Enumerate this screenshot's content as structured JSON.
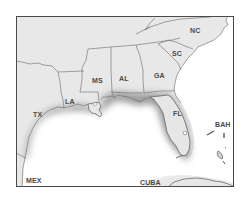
{
  "map": {
    "type": "regional-map",
    "region": "Southeastern United States and Gulf of Mexico",
    "colors": {
      "land": "#e6e6e6",
      "water": "#ffffff",
      "coastal_shading": "#8c8c8c",
      "border": "#5a5a5a",
      "label": "#4a4a4a"
    },
    "labels": [
      {
        "id": "nc",
        "text": "NC",
        "x": 190,
        "y": 33
      },
      {
        "id": "sc",
        "text": "SC",
        "x": 172,
        "y": 56
      },
      {
        "id": "ga",
        "text": "GA",
        "x": 154,
        "y": 78
      },
      {
        "id": "al",
        "text": "AL",
        "x": 119,
        "y": 81
      },
      {
        "id": "ms",
        "text": "MS",
        "x": 92,
        "y": 83
      },
      {
        "id": "la",
        "text": "LA",
        "x": 65,
        "y": 104
      },
      {
        "id": "tx",
        "text": "TX",
        "x": 33,
        "y": 117
      },
      {
        "id": "fl",
        "text": "FL",
        "x": 173,
        "y": 116
      },
      {
        "id": "bah",
        "text": "BAH",
        "x": 215,
        "y": 127
      },
      {
        "id": "mex",
        "text": "MEX",
        "x": 26,
        "y": 183
      },
      {
        "id": "cuba",
        "text": "CUBA",
        "x": 140,
        "y": 185
      }
    ]
  }
}
